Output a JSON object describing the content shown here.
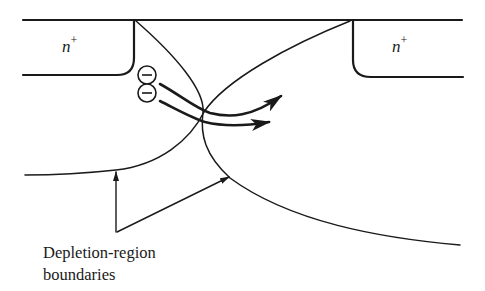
{
  "diagram": {
    "regions": [
      {
        "id": "source",
        "label_base": "n",
        "label_sup": "+"
      },
      {
        "id": "drain",
        "label_base": "n",
        "label_sup": "+"
      }
    ],
    "carriers": [
      {
        "type": "electron",
        "symbol": "−"
      },
      {
        "type": "electron",
        "symbol": "−"
      }
    ],
    "annotation": {
      "lines": [
        "Depletion-region",
        "boundaries"
      ]
    },
    "colors": {
      "ink": "#1a1a1a",
      "background": "#ffffff"
    }
  }
}
